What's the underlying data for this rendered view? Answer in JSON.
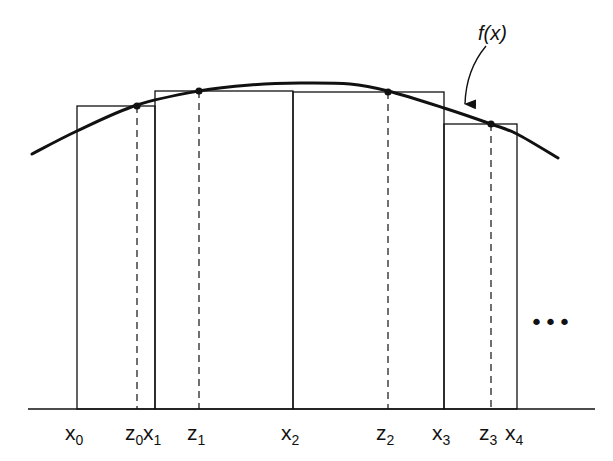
{
  "diagram": {
    "function_label": "f(x)",
    "ellipsis": "•••",
    "colors": {
      "ink": "#111111",
      "background": "#ffffff"
    },
    "baseline": {
      "y": 409,
      "x_start": 28,
      "x_end": 595
    },
    "curve": {
      "points": [
        [
          32,
          154
        ],
        [
          77,
          131
        ],
        [
          137,
          105
        ],
        [
          199,
          91
        ],
        [
          250,
          85
        ],
        [
          300,
          83
        ],
        [
          350,
          84
        ],
        [
          388,
          91
        ],
        [
          444,
          108
        ],
        [
          491,
          124
        ],
        [
          517,
          134
        ],
        [
          558,
          158
        ]
      ]
    },
    "partition_points": [
      {
        "name": "x0",
        "base": "x",
        "sub": "0",
        "x": 77
      },
      {
        "name": "x1",
        "base": "x",
        "sub": "1",
        "x": 155
      },
      {
        "name": "x2",
        "base": "x",
        "sub": "2",
        "x": 293
      },
      {
        "name": "x3",
        "base": "x",
        "sub": "3",
        "x": 444
      },
      {
        "name": "x4",
        "base": "x",
        "sub": "4",
        "x": 517
      }
    ],
    "sample_points": [
      {
        "name": "z0",
        "base": "z",
        "sub": "0",
        "x": 137,
        "y": 106
      },
      {
        "name": "z1",
        "base": "z",
        "sub": "1",
        "x": 199,
        "y": 91
      },
      {
        "name": "z2",
        "base": "z",
        "sub": "2",
        "x": 388,
        "y": 92
      },
      {
        "name": "z3",
        "base": "z",
        "sub": "3",
        "x": 491,
        "y": 124
      }
    ],
    "rectangles": [
      {
        "x_left": 77,
        "x_right": 155,
        "top": 106,
        "label": "[x0,x1] height f(z0)"
      },
      {
        "x_left": 155,
        "x_right": 293,
        "top": 91,
        "label": "[x1,x2] height f(z1)"
      },
      {
        "x_left": 293,
        "x_right": 444,
        "top": 92,
        "label": "[x2,x3] height f(z2)"
      },
      {
        "x_left": 444,
        "x_right": 517,
        "top": 124,
        "label": "[x3,x4] height f(z3)"
      }
    ],
    "axis_labels_y": 440
  }
}
